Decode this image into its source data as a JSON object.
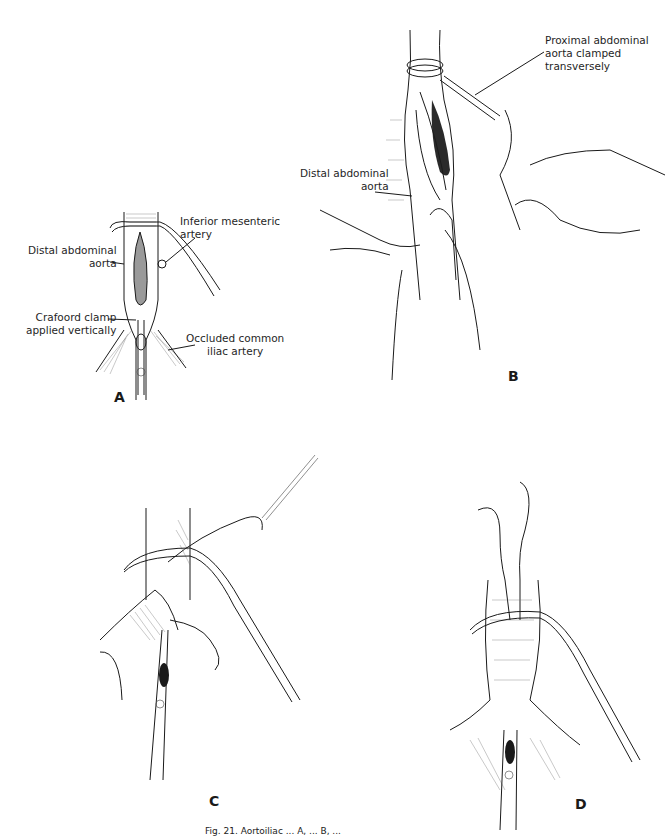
{
  "figure": {
    "panels": [
      {
        "id": "A",
        "letter": "A",
        "labels": {
          "inferior_mesenteric": "Inferior mesenteric\nartery",
          "distal_aorta": "Distal abdominal\naorta",
          "crafoord_clamp": "Crafoord clamp\napplied vertically",
          "occluded_iliac": "Occluded common\niliac artery"
        }
      },
      {
        "id": "B",
        "letter": "B",
        "labels": {
          "proximal_aorta": "Proximal abdominal\naorta clamped\ntransversely",
          "distal_aorta": "Distal abdominal\naorta"
        }
      },
      {
        "id": "C",
        "letter": "C",
        "labels": {}
      },
      {
        "id": "D",
        "letter": "D",
        "labels": {}
      }
    ],
    "caption": "Fig. 21. Aortoiliac ... A, ... B, ..."
  }
}
